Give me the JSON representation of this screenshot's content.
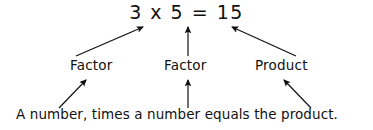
{
  "diagram": {
    "background_color": "#ffffff",
    "ink_color": "#111111",
    "equation": {
      "text": "3 x 5 = 15",
      "operands": [
        "3",
        "5"
      ],
      "operator": "x",
      "equals": "=",
      "result": "15"
    },
    "labels": [
      {
        "id": "factor-1",
        "text": "Factor",
        "points_to": "3"
      },
      {
        "id": "factor-2",
        "text": "Factor",
        "points_to": "5"
      },
      {
        "id": "product",
        "text": "Product",
        "points_to": "15"
      }
    ],
    "sentence": {
      "text": "A number, times a number equals the product.",
      "parts": [
        "A number,",
        "times a number",
        "equals the product."
      ]
    },
    "arrows": [
      {
        "id": "arrow-factor1-to-3",
        "from": [
          76,
          56
        ],
        "to": [
          143,
          27
        ],
        "direction": "up-right"
      },
      {
        "id": "arrow-factor2-to-5",
        "from": [
          188,
          56
        ],
        "to": [
          188,
          27
        ],
        "direction": "up"
      },
      {
        "id": "arrow-product-to-15",
        "from": [
          296,
          56
        ],
        "to": [
          232,
          27
        ],
        "direction": "up-left"
      },
      {
        "id": "arrow-sentence-to-factor1",
        "from": [
          59,
          108
        ],
        "to": [
          86,
          80
        ],
        "direction": "up-right"
      },
      {
        "id": "arrow-sentence-to-factor2",
        "from": [
          188,
          108
        ],
        "to": [
          188,
          80
        ],
        "direction": "up"
      },
      {
        "id": "arrow-sentence-to-product",
        "from": [
          311,
          108
        ],
        "to": [
          284,
          80
        ],
        "direction": "up-left"
      }
    ]
  }
}
